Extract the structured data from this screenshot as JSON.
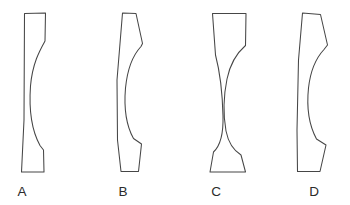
{
  "figure": {
    "canvas": {
      "width": 350,
      "height": 205
    },
    "background_color": "#ffffff",
    "stroke_color": "#464646",
    "fill_color": "#ffffff",
    "label_color": "#2b2b2b"
  },
  "shapes": [
    {
      "id": "shape-a",
      "label": "A",
      "description": "Tall slab: straight-ish left edge bowing left, right edge with a concave sweep curving inward then back out",
      "label_x": 22,
      "label_y": 196,
      "path": "M 24.5 13.5 L 45.5 13.0 L 45.0 41.0 C 40.0 50.0 32.5 63.0 30.5 86.0 C 28.8 110.0 32.0 131.0 40.0 145.5 L 43.5 150.0 L 44.0 172.0 L 21.5 172.0 L 24.0 120.0 Z"
    },
    {
      "id": "shape-b",
      "label": "B",
      "description": "Slender curved column: left edge bows left, right edge has two shoulder notches and a deep concave middle",
      "label_x": 123,
      "label_y": 196,
      "path": "M 122.5 13.0 L 136.0 13.5 L 142.5 43.5 L 141.0 46.5 C 134.0 54.0 127.5 68.0 125.5 88.0 C 123.8 108.0 126.5 126.0 133.5 138.5 L 141.5 144.0 L 138.5 171.5 L 121.0 171.5 L 117.5 140.0 L 117.0 80.0 Z"
    },
    {
      "id": "shape-c",
      "label": "C",
      "description": "Hourglass column: both edges curve inward to a narrow waist at mid-height, flaring to wide flat top and bottom",
      "label_x": 216,
      "label_y": 196,
      "path": "M 212.5 13.5 L 246.0 13.5 L 245.5 45.5 C 238.0 52.0 230.5 62.0 227.0 79.0 C 223.5 96.0 223.0 114.0 226.0 131.0 C 228.5 143.5 233.0 150.0 241.0 155.0 L 245.5 172.0 L 210.0 172.0 L 213.5 152.0 C 220.0 146.0 223.5 134.0 223.0 116.0 C 222.5 96.0 220.0 72.0 215.5 55.0 Z"
    },
    {
      "id": "shape-d",
      "label": "D",
      "description": "Wavy column: left edge bows left, right edge has an S-curve with notched shoulders near top and bottom",
      "label_x": 314,
      "label_y": 196,
      "path": "M 302.5 13.0 L 320.5 14.5 L 327.5 45.0 L 324.0 49.5 C 316.5 57.5 310.5 70.0 308.5 88.0 C 306.5 107.0 309.5 126.0 316.5 139.0 L 326.0 145.0 L 320.0 171.5 L 297.5 171.5 L 297.0 130.0 L 298.5 60.0 Z"
    }
  ]
}
